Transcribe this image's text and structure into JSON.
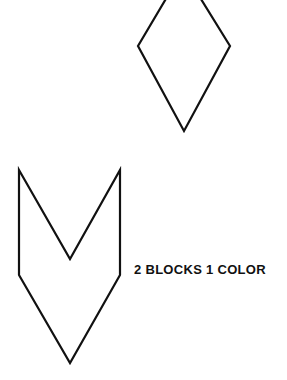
{
  "diagram": {
    "shapes": [
      {
        "name": "diamond",
        "points": [
          [
            183,
            -30
          ],
          [
            230,
            46
          ],
          [
            184,
            131
          ],
          [
            138,
            46
          ]
        ]
      },
      {
        "name": "chevron",
        "points": [
          [
            19,
            170
          ],
          [
            70,
            259
          ],
          [
            120,
            170
          ],
          [
            120,
            275
          ],
          [
            70,
            363
          ],
          [
            19,
            275
          ]
        ]
      }
    ],
    "stroke_color": "#111111",
    "stroke_width": 2.2
  },
  "caption": {
    "text": "2 BLOCKS 1 COLOR"
  }
}
